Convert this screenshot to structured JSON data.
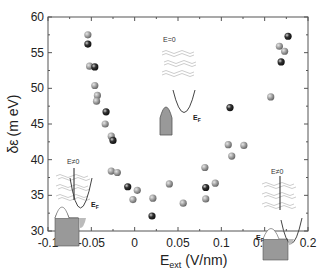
{
  "chart_data": {
    "type": "scatter",
    "title": "",
    "xlabel": "E_ext (V/nm)",
    "xlabel_main": "E",
    "xlabel_sub": "ext",
    "xlabel_unit": "(V/nm)",
    "ylabel": "δε (meV)",
    "ylabel_symbol": "δε",
    "ylabel_unit": "(m eV)",
    "xlim": [
      -0.1,
      0.2
    ],
    "ylim": [
      30,
      60
    ],
    "xticks": [
      -0.1,
      -0.05,
      0,
      0.05,
      0.1,
      0.15,
      0.2
    ],
    "xtick_labels": [
      "-0.1",
      "-0.05",
      "0",
      "0.05",
      "0.1",
      "0.15",
      "0.2"
    ],
    "yticks": [
      30,
      35,
      40,
      45,
      50,
      55,
      60
    ],
    "ytick_labels": [
      "30",
      "35",
      "40",
      "45",
      "50",
      "55",
      "60"
    ],
    "grid": false,
    "legend": null,
    "series": [
      {
        "name": "gray",
        "color": "#9a9a9a",
        "points": [
          [
            -0.054,
            57.5
          ],
          [
            -0.052,
            53.1
          ],
          [
            -0.046,
            50.4
          ],
          [
            -0.043,
            49.0
          ],
          [
            -0.044,
            48.2
          ],
          [
            -0.034,
            45.0
          ],
          [
            -0.027,
            43.3
          ],
          [
            -0.027,
            38.4
          ],
          [
            -0.02,
            38.2
          ],
          [
            0.003,
            35.7
          ],
          [
            -0.002,
            34.4
          ],
          [
            0.021,
            34.6
          ],
          [
            0.04,
            36.6
          ],
          [
            0.056,
            33.9
          ],
          [
            0.082,
            34.5
          ],
          [
            0.093,
            36.7
          ],
          [
            0.108,
            42.1
          ],
          [
            0.126,
            42.0
          ],
          [
            0.112,
            40.5
          ],
          [
            0.157,
            48.8
          ],
          [
            0.167,
            55.9
          ],
          [
            0.173,
            55.2
          ],
          [
            0.081,
            38.9
          ]
        ]
      },
      {
        "name": "black",
        "color": "#1a1a1a",
        "points": [
          [
            -0.054,
            56.2
          ],
          [
            -0.046,
            53.0
          ],
          [
            -0.033,
            46.7
          ],
          [
            -0.025,
            42.7
          ],
          [
            -0.008,
            36.2
          ],
          [
            0.02,
            32.1
          ],
          [
            0.082,
            36.1
          ],
          [
            0.11,
            47.3
          ],
          [
            0.169,
            53.7
          ],
          [
            0.177,
            57.3
          ]
        ]
      }
    ],
    "annotations": [
      {
        "text": "E=0",
        "position": "top-center inset"
      },
      {
        "text": "E≠0",
        "position": "left inset"
      },
      {
        "text": "E≠0",
        "position": "right inset"
      },
      {
        "text": "E_F",
        "position": "center inset band diagram"
      },
      {
        "text": "E_F",
        "position": "left inset band diagram"
      },
      {
        "text": "E_F",
        "position": "right inset band diagram"
      }
    ]
  },
  "labels": {
    "inset_center": "E=0",
    "inset_left": "E≠0",
    "inset_right": "E≠0",
    "ef_main": "E",
    "ef_sub": "F"
  }
}
